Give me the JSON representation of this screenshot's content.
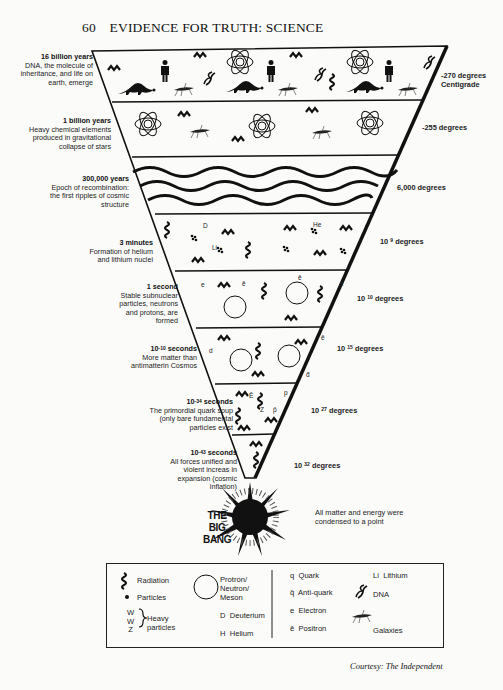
{
  "header": {
    "page_number": "60",
    "title": "EVIDENCE FOR TRUTH: SCIENCE"
  },
  "epochs": [
    {
      "time": "16 billion years",
      "desc": "DNA, the molecule of inheritance, and life on earth, emerge",
      "temperature": "-270 degrees Centigrade"
    },
    {
      "time": "1 billion years",
      "desc": "Heavy chemical elements produced in gravitational collapse of stars",
      "temperature": "-255 degrees"
    },
    {
      "time": "300,000 years",
      "desc": "Epoch of recombination: the first ripples of cosmic structure",
      "temperature": "6,000 degrees"
    },
    {
      "time": "3 minutes",
      "desc": "Formation of helium and lithium nuclei",
      "temp_base": "10",
      "temp_exp": "9",
      "temp_unit": "degrees"
    },
    {
      "time": "1 second",
      "desc": "Stable subnuclear particles, neutrons and protons, are formed",
      "temp_base": "10",
      "temp_exp": "10",
      "temp_unit": "degrees"
    },
    {
      "time_base": "10",
      "time_exp": "-10",
      "time_unit": "seconds",
      "desc": "More matter than antimatterin Cosmos",
      "temp_base": "10",
      "temp_exp": "15",
      "temp_unit": "degrees"
    },
    {
      "time_base": "10",
      "time_exp": "-34",
      "time_unit": "seconds",
      "desc": "The primordial quark soup (only bare fundamental particles exist",
      "temp_base": "10",
      "temp_exp": "27",
      "temp_unit": "degrees"
    },
    {
      "time_base": "10",
      "time_exp": "-43",
      "time_unit": "seconds",
      "desc": "All forces unified and violent increas in expansion (cosmic inflation)",
      "temp_base": "10",
      "temp_exp": "32",
      "temp_unit": "degrees"
    }
  ],
  "big_bang": {
    "line1": "THE",
    "line2": "BIG",
    "line3": "BANG",
    "note": "All matter and energy were condensed to a point"
  },
  "band_symbols": {
    "helium": "He",
    "lithium": "Li",
    "deuterium": "D",
    "electron": "e",
    "positron": "ē",
    "quark": "q",
    "antiquark": "q̄",
    "d": "d",
    "anti_d": "d̄",
    "p": "p",
    "anti_p": "p̄",
    "z": "Z",
    "e_bar": "Ē"
  },
  "legend": {
    "radiation": "Radiation",
    "particles": "Particles",
    "heavy_w1": "W",
    "heavy_w2": "W",
    "heavy_z": "Z",
    "heavy_label1": "Heavy",
    "heavy_label2": "particles",
    "proton_l1": "Protron/",
    "proton_l2": "Neutron/",
    "proton_l3": "Meson",
    "deuterium_sym": "D",
    "deuterium": "Deuterium",
    "helium_sym": "H",
    "helium": "Helium",
    "quark_sym": "q",
    "quark": "Quark",
    "antiquark_sym": "q̄",
    "antiquark": "Anti-quark",
    "electron_sym": "e",
    "electron": "Electron",
    "positron_sym": "ē",
    "positron": "Positron",
    "lithium_sym": "Li",
    "lithium": "Lithium",
    "dna": "DNA",
    "galaxies": "Galaxies"
  },
  "credit": "Courtesy: The Independent"
}
